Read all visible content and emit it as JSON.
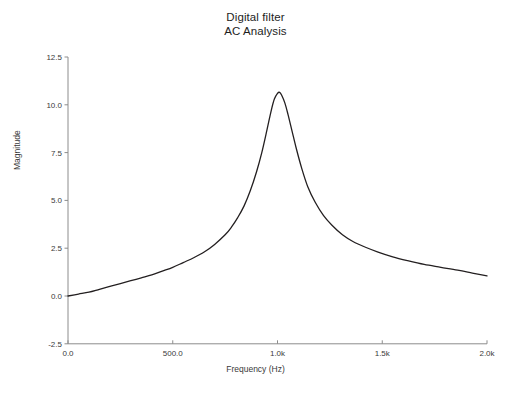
{
  "chart_data": {
    "type": "line",
    "title": "Digital filter",
    "subtitle": "AC Analysis",
    "xlabel": "Frequency (Hz)",
    "ylabel": "Magnitude",
    "grid": false,
    "legend": "none",
    "xlim": [
      0,
      2000
    ],
    "ylim": [
      -2.5,
      12.5
    ],
    "xticks": [
      0,
      500,
      1000,
      1500,
      2000
    ],
    "xtick_labels": [
      "0.0",
      "500.0",
      "1.0k",
      "1.5k",
      "2.0k"
    ],
    "yticks": [
      -2.5,
      0.0,
      2.5,
      5.0,
      7.5,
      10.0,
      12.5
    ],
    "ytick_labels": [
      "-2.5",
      "0.0",
      "2.5",
      "5.0",
      "7.5",
      "10.0",
      "12.5"
    ],
    "line_color": "#231f20",
    "line_width": 1.3,
    "series": [
      {
        "name": "Magnitude",
        "x": [
          0,
          50,
          100,
          150,
          200,
          250,
          300,
          350,
          400,
          450,
          500,
          550,
          600,
          650,
          700,
          750,
          780,
          810,
          840,
          870,
          900,
          925,
          950,
          970,
          985,
          1000,
          1010,
          1020,
          1035,
          1050,
          1070,
          1090,
          1115,
          1145,
          1180,
          1220,
          1260,
          1310,
          1360,
          1420,
          1480,
          1550,
          1620,
          1700,
          1780,
          1860,
          1930,
          2000
        ],
        "y": [
          0.0,
          0.1,
          0.2,
          0.35,
          0.5,
          0.65,
          0.8,
          0.95,
          1.1,
          1.3,
          1.5,
          1.75,
          2.0,
          2.3,
          2.7,
          3.2,
          3.6,
          4.1,
          4.7,
          5.5,
          6.5,
          7.5,
          8.7,
          9.7,
          10.3,
          10.6,
          10.65,
          10.5,
          10.1,
          9.5,
          8.6,
          7.7,
          6.7,
          5.7,
          4.9,
          4.2,
          3.7,
          3.2,
          2.85,
          2.55,
          2.3,
          2.05,
          1.85,
          1.65,
          1.5,
          1.35,
          1.2,
          1.05
        ]
      }
    ]
  },
  "axes": {
    "axis_color": "#8c8c8c",
    "tick_color": "#8c8c8c"
  }
}
